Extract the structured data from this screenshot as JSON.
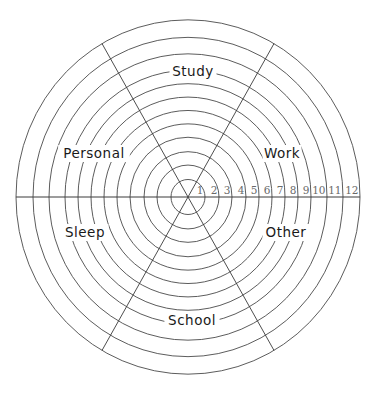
{
  "diagram": {
    "type": "wheel-of-life",
    "center": {
      "x": 188,
      "y": 197
    },
    "scale_y": 1.03,
    "ring_radii": [
      17,
      31,
      44,
      58,
      71,
      84,
      97,
      110,
      123,
      139,
      155,
      172
    ],
    "scale_labels": [
      "1",
      "2",
      "3",
      "4",
      "5",
      "6",
      "7",
      "8",
      "9",
      "10",
      "11",
      "12"
    ],
    "spoke_angles_deg": [
      60,
      120,
      240,
      300
    ],
    "sectors": [
      {
        "id": "study",
        "label": "Study",
        "x": 193,
        "y": 76
      },
      {
        "id": "work",
        "label": "Work",
        "x": 282,
        "y": 158
      },
      {
        "id": "other",
        "label": "Other",
        "x": 286,
        "y": 237
      },
      {
        "id": "school",
        "label": "School",
        "x": 192,
        "y": 325
      },
      {
        "id": "sleep",
        "label": "Sleep",
        "x": 85,
        "y": 237
      },
      {
        "id": "personal",
        "label": "Personal",
        "x": 94,
        "y": 158
      }
    ],
    "colors": {
      "line": "#3a3a3a",
      "tick_text": "#6a6a6a",
      "label_text": "#1a1a1a",
      "background": "#ffffff"
    }
  }
}
